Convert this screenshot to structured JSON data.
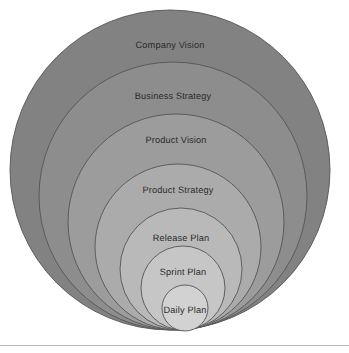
{
  "diagram": {
    "type": "concentric-circles",
    "background_color": "#ffffff",
    "stroke_color": "#555555",
    "label_color": "#2b2b2b",
    "bottom_tangent_y": 330,
    "footer_rule": {
      "y": 345,
      "color": "#b9b9b9"
    },
    "rings": [
      {
        "id": "company-vision",
        "label": "Company Vision",
        "level": 1,
        "fill": "#828282",
        "cx": 170,
        "cy": 170,
        "r": 160,
        "label_x": 170,
        "label_y": 45
      },
      {
        "id": "business-strategy",
        "label": "Business Strategy",
        "level": 2,
        "fill": "#8d8d8d",
        "cx": 173,
        "cy": 196,
        "r": 134,
        "label_x": 173,
        "label_y": 96
      },
      {
        "id": "product-vision",
        "label": "Product Vision",
        "level": 3,
        "fill": "#9c9c9c",
        "cx": 176,
        "cy": 222,
        "r": 108,
        "label_x": 176,
        "label_y": 140
      },
      {
        "id": "product-strategy",
        "label": "Product Strategy",
        "level": 4,
        "fill": "#ababab",
        "cx": 178,
        "cy": 247,
        "r": 83,
        "label_x": 178,
        "label_y": 190
      },
      {
        "id": "release-plan",
        "label": "Release Plan",
        "level": 5,
        "fill": "#b9b9b9",
        "cx": 181,
        "cy": 269,
        "r": 61,
        "label_x": 181,
        "label_y": 238
      },
      {
        "id": "sprint-plan",
        "label": "Sprint Plan",
        "level": 6,
        "fill": "#c6c6c6",
        "cx": 183,
        "cy": 288,
        "r": 42,
        "label_x": 183,
        "label_y": 272
      },
      {
        "id": "daily-plan",
        "label": "Daily Plan",
        "level": 7,
        "fill": "#d2d2d2",
        "cx": 185,
        "cy": 308,
        "r": 23,
        "label_x": 185,
        "label_y": 310
      }
    ]
  }
}
